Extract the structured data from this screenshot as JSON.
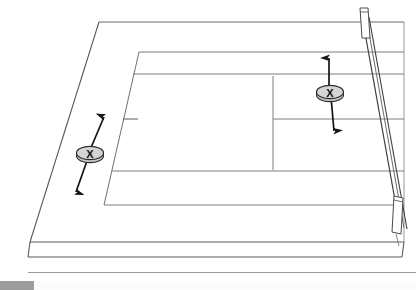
{
  "figure": {
    "background_color": "#ffffff",
    "line_color": "#5a5a5a",
    "line_color_dark": "#2b2b2b",
    "arrow_color": "#1a1a1a",
    "disc_fill": "#d0d0d0",
    "disc_edge": "#2b2b2b"
  },
  "markers": [
    {
      "id": "marker-left",
      "label": "X",
      "cx": 90,
      "cy": 153,
      "rx": 13,
      "ry": 6.5,
      "arrow_direction": "double",
      "arrow_top": {
        "x": 104,
        "y": 113
      },
      "arrow_bottom": {
        "x": 75,
        "y": 196
      }
    },
    {
      "id": "marker-right",
      "label": "X",
      "cx": 330,
      "cy": 92,
      "rx": 13,
      "ry": 6.5,
      "arrow_direction": "double",
      "arrow_top": {
        "x": 329,
        "y": 53
      },
      "arrow_bottom": {
        "x": 334,
        "y": 135
      }
    }
  ],
  "parts": {
    "board_label": "board",
    "inner_panel_label": "inner-panel",
    "rail_label": "right-edge-rail",
    "rail_post_top_label": "rail-post-top",
    "rail_post_bottom_label": "rail-post-bottom",
    "edge_tick_label": "edge-tick"
  },
  "footer": {
    "chip_color": "#9d9d9d",
    "rule_color": "#9a9a9a"
  }
}
